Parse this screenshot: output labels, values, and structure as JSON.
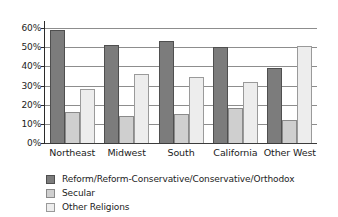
{
  "chart_data": {
    "type": "bar",
    "title": "",
    "subtitle": "",
    "xlabel": "",
    "ylabel": "",
    "categories": [
      "Northeast",
      "Midwest",
      "South",
      "California",
      "Other West"
    ],
    "series": [
      {
        "name": "Reform/Reform-Conservative/Conservative/Orthodox",
        "color": "#7c7c7c",
        "values": [
          59,
          51,
          53,
          50,
          39
        ]
      },
      {
        "name": "Secular",
        "color": "#cfcfcf",
        "values": [
          16,
          14,
          15,
          18.5,
          12
        ]
      },
      {
        "name": "Other Religions",
        "color": "#ededed",
        "values": [
          28,
          36,
          34.5,
          32,
          50.5
        ]
      }
    ],
    "ylim": [
      0,
      60
    ],
    "ytick_values": [
      0,
      10,
      20,
      30,
      40,
      50,
      60
    ],
    "ytick_labels": [
      "0%",
      "10%",
      "20%",
      "30%",
      "40%",
      "50%",
      "60%"
    ],
    "grid": true,
    "grid_axis": "y",
    "legend_position": "bottom-left",
    "annotations": []
  },
  "legend": {
    "items": [
      {
        "label": "Reform/Reform-Conservative/Conservative/Orthodox",
        "swatch": "series-0-swatch"
      },
      {
        "label": "Secular",
        "swatch": "series-1-swatch"
      },
      {
        "label": "Other Religions",
        "swatch": "series-2-swatch"
      }
    ]
  }
}
